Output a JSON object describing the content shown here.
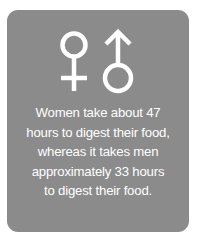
{
  "card": {
    "background": "#8b8b8b",
    "icons": [
      "female-symbol-icon",
      "male-symbol-icon"
    ],
    "lines": [
      "Women take about 47",
      "hours to digest their food,",
      "whereas it takes men",
      "approximately 33 hours",
      "to digest their food."
    ]
  }
}
